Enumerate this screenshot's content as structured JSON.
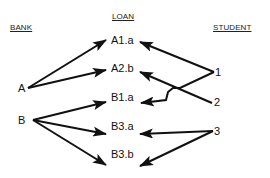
{
  "headers": {
    "bank": "BANK",
    "loan": "LOAN",
    "student": "STUDENT"
  },
  "banks": [
    {
      "id": "A",
      "label": "A"
    },
    {
      "id": "B",
      "label": "B"
    }
  ],
  "loans": [
    {
      "id": "A1.a",
      "label": "A1.a"
    },
    {
      "id": "A2.b",
      "label": "A2.b"
    },
    {
      "id": "B1.a",
      "label": "B1.a"
    },
    {
      "id": "B3.a",
      "label": "B3.a"
    },
    {
      "id": "B3.b",
      "label": "B3.b"
    }
  ],
  "students": [
    {
      "id": "1",
      "label": "1"
    },
    {
      "id": "2",
      "label": "2"
    },
    {
      "id": "3",
      "label": "3"
    }
  ],
  "edges": [
    {
      "from": "A",
      "to": "A1.a"
    },
    {
      "from": "A",
      "to": "A2.b"
    },
    {
      "from": "B",
      "to": "B1.a"
    },
    {
      "from": "B",
      "to": "B3.a"
    },
    {
      "from": "B",
      "to": "B3.b"
    },
    {
      "from": "1",
      "to": "A1.a"
    },
    {
      "from": "1",
      "to": "B1.a"
    },
    {
      "from": "2",
      "to": "A2.b"
    },
    {
      "from": "3",
      "to": "B3.a"
    },
    {
      "from": "3",
      "to": "B3.b"
    }
  ],
  "colors": {
    "line": "#111111",
    "background": "#ffffff"
  }
}
